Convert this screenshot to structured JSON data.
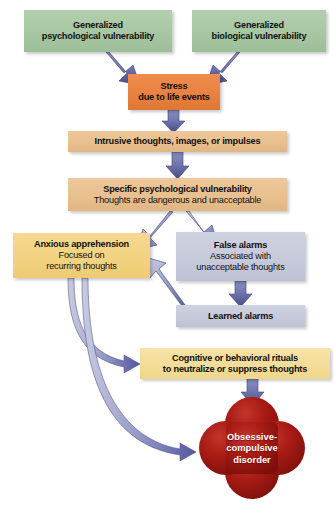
{
  "diagram": {
    "nodes": [
      {
        "id": "gen-psych",
        "title": "Generalized",
        "subtitle": "psychological vulnerability",
        "color": "#a7c7a2",
        "shape": "rect"
      },
      {
        "id": "gen-bio",
        "title": "Generalized",
        "subtitle": "biological vulnerability",
        "color": "#a7c7a2",
        "shape": "rect"
      },
      {
        "id": "stress",
        "title": "Stress",
        "subtitle": "due to life events",
        "color": "#e8813f",
        "shape": "rect"
      },
      {
        "id": "intrusive",
        "title": "Intrusive thoughts, images, or impulses",
        "subtitle": "",
        "color": "#e8bf8e",
        "shape": "rect"
      },
      {
        "id": "specific-vuln",
        "title": "Specific psychological vulnerability",
        "subtitle": "Thoughts are dangerous and unacceptable",
        "color": "#e8bf8e",
        "shape": "rect"
      },
      {
        "id": "anxious",
        "title": "Anxious apprehension",
        "subtitle": "Focused on\nrecurring thoughts",
        "sub_line1": "Focused on",
        "sub_line2": "recurring thoughts",
        "color": "#f2d281",
        "shape": "rect"
      },
      {
        "id": "false-alarms",
        "title": "False alarms",
        "subtitle": "Associated with\nunacceptable thoughts",
        "sub_line1": "Associated with",
        "sub_line2": "unacceptable thoughts",
        "color": "#c6c9da",
        "shape": "rect"
      },
      {
        "id": "learned-alarms",
        "title": "Learned alarms",
        "subtitle": "",
        "color": "#c6c9da",
        "shape": "rect"
      },
      {
        "id": "rituals",
        "title": "Cognitive or behavioral rituals",
        "subtitle": "to neutralize or suppress thoughts",
        "line1": "Cognitive or behavioral rituals",
        "line2": "to neutralize or suppress thoughts",
        "color": "#f3dc97",
        "shape": "rect"
      },
      {
        "id": "ocd",
        "line1": "Obsessive-",
        "line2": "compulsive",
        "line3": "disorder",
        "color": "#a81c15",
        "shape": "quatrefoil"
      }
    ],
    "arrows": [
      {
        "id": "arrow-genpsych-to-stress",
        "from": "gen-psych",
        "to": "stress",
        "style": "straight-diagonal",
        "color": "#5b5f9c"
      },
      {
        "id": "arrow-genbio-to-stress",
        "from": "gen-bio",
        "to": "stress",
        "style": "straight-diagonal",
        "color": "#5b5f9c"
      },
      {
        "id": "arrow-stress-to-intrusive",
        "from": "stress",
        "to": "intrusive",
        "style": "straight-vertical",
        "color": "#5b5f9c"
      },
      {
        "id": "arrow-intrusive-to-specific",
        "from": "intrusive",
        "to": "specific-vuln",
        "style": "straight-vertical",
        "color": "#5b5f9c"
      },
      {
        "id": "arrow-specific-to-anxious",
        "from": "specific-vuln",
        "to": "anxious",
        "style": "straight-diagonal",
        "color": "#5b5f9c"
      },
      {
        "id": "arrow-specific-to-falsealarms",
        "from": "specific-vuln",
        "to": "false-alarms",
        "style": "straight-diagonal",
        "color": "#5b5f9c"
      },
      {
        "id": "arrow-falsealarms-to-learnedalarms",
        "from": "false-alarms",
        "to": "learned-alarms",
        "style": "straight-vertical",
        "color": "#5b5f9c"
      },
      {
        "id": "arrow-learnedalarms-to-anxious",
        "from": "learned-alarms",
        "to": "anxious",
        "style": "straight-diagonal",
        "color": "#5b5f9c"
      },
      {
        "id": "arrow-anxious-to-rituals",
        "from": "anxious",
        "to": "rituals",
        "style": "curved",
        "color": "#5b5f9c"
      },
      {
        "id": "arrow-anxious-to-ocd",
        "from": "anxious",
        "to": "ocd",
        "style": "curved",
        "color": "#5b5f9c"
      },
      {
        "id": "arrow-rituals-to-ocd",
        "from": "rituals",
        "to": "ocd",
        "style": "straight-vertical",
        "color": "#5b5f9c"
      }
    ]
  }
}
